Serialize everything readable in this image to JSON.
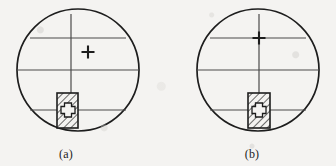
{
  "figure": {
    "background_color": "#f4f3f1",
    "ink_color": "#1d1d1d",
    "line_color": "#3a3a3a",
    "panels": [
      {
        "id": "a",
        "caption": "(a)",
        "caption_x": 80,
        "caption_y": 152,
        "circle": {
          "cx": 78,
          "cy": 70,
          "r": 61
        },
        "vertical_line": {
          "x": 71,
          "y1": 14,
          "y2": 128
        },
        "horizontal_lines": [
          {
            "y": 38,
            "x1": 30,
            "x2": 126
          },
          {
            "y": 70,
            "x1": 17,
            "x2": 139
          },
          {
            "y": 110,
            "x1": 30,
            "x2": 126
          }
        ],
        "hatched_box": {
          "x": 57,
          "y": 93,
          "width": 21,
          "height": 35
        },
        "hatch_angle_deg": 45,
        "hatch_spacing": 4,
        "cross_marks": [
          {
            "name": "upper-cross",
            "cx": 88,
            "cy": 52,
            "size": 11,
            "bold": true
          },
          {
            "name": "box-cross",
            "cx": 68,
            "cy": 110,
            "size": 13,
            "outlined": true
          }
        ]
      },
      {
        "id": "b",
        "caption": "(b)",
        "caption_x": 90,
        "caption_y": 152,
        "circle": {
          "cx": 90,
          "cy": 70,
          "r": 61
        },
        "vertical_line": {
          "x": 91,
          "y1": 14,
          "y2": 128
        },
        "horizontal_lines": [
          {
            "y": 38,
            "x1": 42,
            "x2": 138
          },
          {
            "y": 70,
            "x1": 29,
            "x2": 151
          },
          {
            "y": 110,
            "x1": 42,
            "x2": 138
          }
        ],
        "hatched_box": {
          "x": 80,
          "y": 93,
          "width": 22,
          "height": 35
        },
        "hatch_angle_deg": 45,
        "hatch_spacing": 4,
        "cross_marks": [
          {
            "name": "upper-cross",
            "cx": 91,
            "cy": 38,
            "size": 11,
            "bold": true
          },
          {
            "name": "box-cross",
            "cx": 91,
            "cy": 110,
            "size": 13,
            "outlined": true
          }
        ]
      }
    ]
  }
}
